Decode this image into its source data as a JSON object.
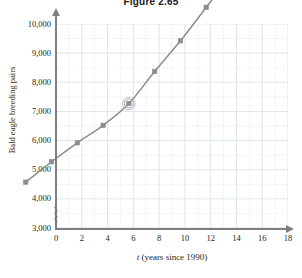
{
  "figure": {
    "title": "Figure 2.65"
  },
  "chart_data": {
    "type": "line",
    "title": "Figure 2.65",
    "xlabel": "t (years since 1990)",
    "ylabel": "Bald eagle breeding pairs",
    "xlim": [
      0,
      18
    ],
    "ylim": [
      3000,
      10000
    ],
    "grid": true,
    "legend": false,
    "axis_break_y": true,
    "x": [
      2,
      4,
      6,
      8,
      10,
      12,
      14,
      16
    ],
    "values": [
      3750,
      4450,
      5100,
      5700,
      6450,
      7550,
      8600,
      9750
    ],
    "highlighted_point": {
      "x": 10,
      "y": 6450
    },
    "xticks": [
      0,
      2,
      4,
      6,
      8,
      10,
      12,
      14,
      16,
      18
    ],
    "xticklabels": [
      "0",
      "2",
      "4",
      "6",
      "8",
      "10",
      "12",
      "14",
      "16",
      "18"
    ],
    "yticks": [
      3000,
      4000,
      5000,
      6000,
      7000,
      8000,
      9000,
      10000
    ],
    "yticklabels": [
      "3,000",
      "4,000",
      "5,000",
      "6,000",
      "7,000",
      "8,000",
      "9,000",
      "10,000"
    ],
    "colors": {
      "curve": "#8c8c8c",
      "marker": "#8c8c8c",
      "grid": "#d9e2ec",
      "axis": "#7d7f82",
      "text": "#231f20"
    }
  },
  "axes": {
    "x_title": "t (years since 1990)",
    "x_title_italic": "t",
    "x_title_rest": " (years since 1990)",
    "y_title": "Bald eagle breeding pairs"
  }
}
